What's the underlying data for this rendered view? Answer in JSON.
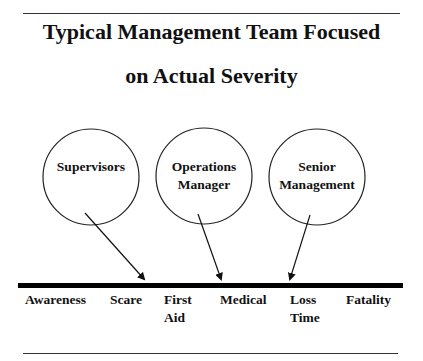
{
  "title": {
    "line1": "Typical Management Team Focused",
    "line2": "on Actual Severity"
  },
  "circles": [
    {
      "label_lines": [
        "Supervisors"
      ]
    },
    {
      "label_lines": [
        "Operations",
        "Manager"
      ]
    },
    {
      "label_lines": [
        "Senior",
        "Management"
      ]
    }
  ],
  "scale": {
    "labels": [
      {
        "lines": [
          "Awareness"
        ]
      },
      {
        "lines": [
          "Scare"
        ]
      },
      {
        "lines": [
          "First",
          "Aid"
        ]
      },
      {
        "lines": [
          "Medical"
        ]
      },
      {
        "lines": [
          "Loss",
          "Time"
        ]
      },
      {
        "lines": [
          "Fatality"
        ]
      }
    ]
  },
  "colors": {
    "line": "#111111",
    "background": "#ffffff"
  }
}
